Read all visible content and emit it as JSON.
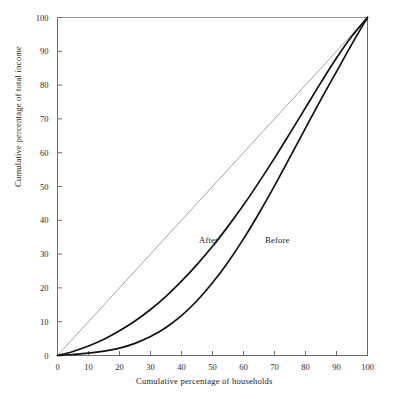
{
  "chart_data": {
    "type": "line",
    "title": "",
    "xlabel": "Cumulative percentage of households",
    "ylabel": "Cumulative percentage of total income",
    "xlim": [
      0,
      100
    ],
    "ylim": [
      0,
      100
    ],
    "grid": false,
    "legend_position": "inline-annotations",
    "xticks": [
      "0",
      "10",
      "20",
      "30",
      "40",
      "50",
      "60",
      "70",
      "80",
      "90",
      "100"
    ],
    "yticks": [
      "0",
      "10",
      "20",
      "30",
      "40",
      "50",
      "60",
      "70",
      "80",
      "90",
      "100"
    ],
    "xtick_values": [
      0,
      10,
      20,
      30,
      40,
      50,
      60,
      70,
      80,
      90,
      100
    ],
    "ytick_values": [
      0,
      10,
      20,
      30,
      40,
      50,
      60,
      70,
      80,
      90,
      100
    ],
    "annotations": [
      {
        "text": "After",
        "x": 44,
        "y": 34
      },
      {
        "text": "Before",
        "x": 63,
        "y": 34
      }
    ],
    "series": [
      {
        "name": "Line of equality",
        "style": "thin",
        "color": "#8c8c8c",
        "x": [
          0,
          100
        ],
        "values": [
          0,
          100
        ]
      },
      {
        "name": "After",
        "style": "thick",
        "color": "#111111",
        "x": [
          0,
          5,
          10,
          15,
          20,
          25,
          30,
          35,
          40,
          45,
          50,
          55,
          60,
          65,
          70,
          75,
          80,
          85,
          90,
          95,
          100
        ],
        "values": [
          0,
          1.2,
          2.8,
          4.8,
          7.3,
          10.2,
          13.6,
          17.5,
          22.0,
          26.9,
          32.3,
          38.2,
          44.5,
          51.3,
          58.4,
          65.8,
          73.3,
          80.8,
          88.0,
          94.5,
          100
        ]
      },
      {
        "name": "Before",
        "style": "thick",
        "color": "#111111",
        "x": [
          0,
          5,
          10,
          15,
          20,
          25,
          30,
          35,
          40,
          45,
          50,
          55,
          60,
          65,
          70,
          75,
          80,
          85,
          90,
          95,
          100
        ],
        "values": [
          0,
          0.3,
          0.7,
          1.3,
          2.2,
          3.6,
          5.6,
          8.3,
          11.8,
          16.2,
          21.5,
          27.6,
          34.5,
          42.1,
          50.2,
          58.7,
          67.3,
          75.8,
          84.0,
          92.2,
          100
        ]
      }
    ]
  },
  "axes": {
    "x_title": "Cumulative percentage of households",
    "y_title": "Cumulative percentage of total income"
  },
  "colors": {
    "frame": "#6d6d6d",
    "equality_line": "#8c8c8c",
    "curve": "#111111",
    "background": "#ffffff",
    "text": "#1a1a1a"
  }
}
